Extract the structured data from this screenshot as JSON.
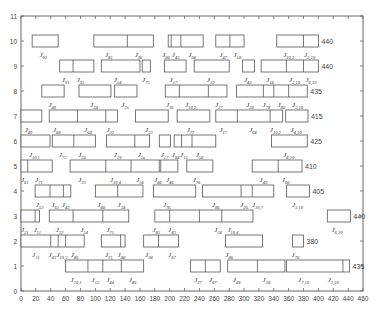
{
  "chart_data": {
    "type": "gantt",
    "title": "",
    "xlabel": "",
    "ylabel": "",
    "xlim": [
      0,
      460
    ],
    "ylim": [
      0,
      11
    ],
    "xticks": [
      0,
      20,
      40,
      60,
      80,
      100,
      120,
      140,
      160,
      180,
      200,
      220,
      240,
      260,
      280,
      300,
      320,
      340,
      360,
      380,
      400,
      420,
      440,
      460
    ],
    "yticks": [
      0,
      1,
      2,
      3,
      4,
      5,
      6,
      7,
      8,
      9,
      10,
      11
    ],
    "grid": false,
    "rows": [
      {
        "y": 10,
        "right_value": "440",
        "boxes": [
          {
            "start": 15,
            "end": 50,
            "splits": [],
            "labels": [
              {
                "x": 30,
                "text": "J02"
              }
            ]
          },
          {
            "start": 98,
            "end": 178,
            "splits": [
              143
            ],
            "labels": [
              {
                "x": 118,
                "text": "J85"
              },
              {
                "x": 158,
                "text": "J96"
              }
            ]
          },
          {
            "start": 198,
            "end": 245,
            "splits": [
              202,
              215
            ],
            "labels": [
              {
                "x": 195,
                "text": "J86"
              },
              {
                "x": 208,
                "text": "J45"
              },
              {
                "x": 230,
                "text": "J98"
              }
            ]
          },
          {
            "start": 262,
            "end": 300,
            "splits": [
              281
            ],
            "labels": [
              {
                "x": 272,
                "text": "J47"
              },
              {
                "x": 291,
                "text": "J58"
              }
            ]
          },
          {
            "start": 344,
            "end": 400,
            "splits": [
              380
            ],
            "labels": [
              {
                "x": 360,
                "text": "J10,3"
              },
              {
                "x": 388,
                "text": "J3,10"
              }
            ]
          }
        ]
      },
      {
        "y": 9,
        "right_value": "440",
        "boxes": [
          {
            "start": 52,
            "end": 98,
            "splits": [
              70
            ],
            "labels": [
              {
                "x": 60,
                "text": "J91"
              },
              {
                "x": 80,
                "text": "J92"
              }
            ]
          },
          {
            "start": 108,
            "end": 160,
            "splits": [],
            "labels": [
              {
                "x": 130,
                "text": "J54"
              }
            ]
          },
          {
            "start": 163,
            "end": 174,
            "splits": [],
            "labels": [
              {
                "x": 168,
                "text": "J75"
              }
            ]
          },
          {
            "start": 193,
            "end": 222,
            "splits": [],
            "labels": [
              {
                "x": 205,
                "text": "J17"
              }
            ]
          },
          {
            "start": 233,
            "end": 280,
            "splits": [],
            "labels": [
              {
                "x": 255,
                "text": "J19"
              }
            ]
          },
          {
            "start": 298,
            "end": 314,
            "splits": [],
            "labels": [
              {
                "x": 305,
                "text": "J42"
              }
            ]
          },
          {
            "start": 323,
            "end": 400,
            "splits": [
              357,
              380
            ],
            "labels": [
              {
                "x": 335,
                "text": "J18"
              },
              {
                "x": 368,
                "text": "J2,10"
              },
              {
                "x": 390,
                "text": "J8,10"
              }
            ]
          }
        ]
      },
      {
        "y": 8,
        "right_value": "435",
        "boxes": [
          {
            "start": 28,
            "end": 58,
            "splits": [],
            "labels": [
              {
                "x": 42,
                "text": "J40"
              }
            ]
          },
          {
            "start": 78,
            "end": 121,
            "splits": [],
            "labels": [
              {
                "x": 98,
                "text": "J34"
              }
            ]
          },
          {
            "start": 126,
            "end": 156,
            "splits": [],
            "labels": [
              {
                "x": 140,
                "text": "J25"
              }
            ]
          },
          {
            "start": 194,
            "end": 277,
            "splits": [
              213,
              252
            ],
            "labels": [
              {
                "x": 200,
                "text": "J36"
              },
              {
                "x": 228,
                "text": "J10,2"
              },
              {
                "x": 266,
                "text": "J27"
              }
            ]
          },
          {
            "start": 290,
            "end": 385,
            "splits": [
              326,
              340,
              360
            ],
            "labels": [
              {
                "x": 308,
                "text": "J28"
              },
              {
                "x": 330,
                "text": "J78"
              },
              {
                "x": 350,
                "text": "J88"
              },
              {
                "x": 372,
                "text": "J3,10"
              }
            ]
          }
        ]
      },
      {
        "y": 7,
        "right_value": "415",
        "boxes": [
          {
            "start": 0,
            "end": 28,
            "splits": [],
            "labels": [
              {
                "x": 10,
                "text": "J40"
              }
            ]
          },
          {
            "start": 38,
            "end": 130,
            "splits": [
              76,
              114
            ],
            "labels": [
              {
                "x": 48,
                "text": "J88"
              },
              {
                "x": 90,
                "text": "J64"
              },
              {
                "x": 120,
                "text": "J32"
              }
            ]
          },
          {
            "start": 154,
            "end": 198,
            "splits": [],
            "labels": [
              {
                "x": 172,
                "text": "J23"
              }
            ]
          },
          {
            "start": 210,
            "end": 254,
            "splits": [],
            "labels": [
              {
                "x": 228,
                "text": "J77"
              }
            ]
          },
          {
            "start": 262,
            "end": 352,
            "splits": [
              291,
              335
            ],
            "labels": [
              {
                "x": 272,
                "text": "J17"
              },
              {
                "x": 312,
                "text": "J68"
              },
              {
                "x": 342,
                "text": "J10,2"
              }
            ]
          },
          {
            "start": 356,
            "end": 386,
            "splits": [],
            "labels": [
              {
                "x": 370,
                "text": "J4,10"
              }
            ]
          }
        ]
      },
      {
        "y": 6,
        "right_value": "425",
        "boxes": [
          {
            "start": 0,
            "end": 39,
            "splits": [],
            "labels": [
              {
                "x": 18,
                "text": "J10,1"
              }
            ]
          },
          {
            "start": 42,
            "end": 100,
            "splits": [
              71
            ],
            "labels": [
              {
                "x": 56,
                "text": "J72"
              },
              {
                "x": 82,
                "text": "J26"
              }
            ]
          },
          {
            "start": 115,
            "end": 173,
            "splits": [
              153
            ],
            "labels": [
              {
                "x": 130,
                "text": "J29"
              },
              {
                "x": 162,
                "text": "J2e"
              }
            ]
          },
          {
            "start": 186,
            "end": 201,
            "splits": [],
            "labels": [
              {
                "x": 193,
                "text": "J17"
              }
            ]
          },
          {
            "start": 206,
            "end": 262,
            "splits": [
              216,
              230
            ],
            "labels": [
              {
                "x": 208,
                "text": "J84"
              },
              {
                "x": 219,
                "text": "J15"
              },
              {
                "x": 240,
                "text": "J58"
              }
            ]
          },
          {
            "start": 337,
            "end": 385,
            "splits": [],
            "labels": [
              {
                "x": 360,
                "text": "J4,10"
              }
            ]
          }
        ]
      },
      {
        "y": 5,
        "right_value": "410",
        "boxes": [
          {
            "start": 0,
            "end": 42,
            "splits": [
              9
            ],
            "labels": [
              {
                "x": 5,
                "text": "J81"
              },
              {
                "x": 24,
                "text": "J71"
              }
            ]
          },
          {
            "start": 66,
            "end": 211,
            "splits": [
              114,
              148,
              186,
              188
            ],
            "labels": [
              {
                "x": 82,
                "text": "J23"
              },
              {
                "x": 127,
                "text": "J10,4"
              },
              {
                "x": 160,
                "text": "J36"
              },
              {
                "x": 184,
                "text": "J88"
              },
              {
                "x": 200,
                "text": "J46"
              }
            ]
          },
          {
            "start": 223,
            "end": 258,
            "splits": [],
            "labels": [
              {
                "x": 236,
                "text": "J76"
              }
            ]
          },
          {
            "start": 311,
            "end": 378,
            "splits": [
              346
            ],
            "labels": [
              {
                "x": 326,
                "text": "J49"
              },
              {
                "x": 356,
                "text": "J66"
              }
            ]
          }
        ]
      },
      {
        "y": 4,
        "right_value": "405",
        "boxes": [
          {
            "start": 19,
            "end": 67,
            "splits": [
              39,
              57
            ],
            "labels": [
              {
                "x": 25,
                "text": "J52"
              },
              {
                "x": 46,
                "text": "J61"
              },
              {
                "x": 60,
                "text": "J42"
              }
            ]
          },
          {
            "start": 100,
            "end": 164,
            "splits": [
              130
            ],
            "labels": [
              {
                "x": 108,
                "text": "J88"
              },
              {
                "x": 135,
                "text": "J34"
              }
            ]
          },
          {
            "start": 178,
            "end": 235,
            "splits": [],
            "labels": [
              {
                "x": 196,
                "text": "J76"
              }
            ]
          },
          {
            "start": 244,
            "end": 340,
            "splits": [
              296,
              311
            ],
            "labels": [
              {
                "x": 262,
                "text": "J86"
              },
              {
                "x": 300,
                "text": "J26"
              },
              {
                "x": 318,
                "text": "J10,7"
              }
            ]
          },
          {
            "start": 357,
            "end": 388,
            "splits": [],
            "labels": [
              {
                "x": 372,
                "text": "J5,10"
              }
            ]
          }
        ]
      },
      {
        "y": 3,
        "right_value": "440",
        "boxes": [
          {
            "start": 0,
            "end": 25,
            "splits": [
              19
            ],
            "labels": [
              {
                "x": 5,
                "text": "J21"
              },
              {
                "x": 22,
                "text": "J11"
              }
            ]
          },
          {
            "start": 38,
            "end": 145,
            "splits": [
              70,
              110
            ],
            "labels": [
              {
                "x": 52,
                "text": "J22"
              },
              {
                "x": 85,
                "text": "J14"
              },
              {
                "x": 120,
                "text": "J71"
              }
            ]
          },
          {
            "start": 180,
            "end": 312,
            "splits": [
              200,
              240,
              270
            ],
            "labels": [
              {
                "x": 182,
                "text": "J83"
              },
              {
                "x": 203,
                "text": "J43"
              },
              {
                "x": 265,
                "text": "J58"
              },
              {
                "x": 285,
                "text": "J10,4"
              }
            ]
          },
          {
            "start": 412,
            "end": 443,
            "splits": [],
            "labels": [
              {
                "x": 425,
                "text": "J6,10"
              }
            ]
          }
        ]
      },
      {
        "y": 2,
        "right_value": "380",
        "boxes": [
          {
            "start": 0,
            "end": 85,
            "splits": [
              40,
              50,
              60
            ],
            "labels": [
              {
                "x": 20,
                "text": "J31"
              },
              {
                "x": 42,
                "text": "J43"
              },
              {
                "x": 55,
                "text": "J10,3"
              },
              {
                "x": 72,
                "text": "J86"
              }
            ]
          },
          {
            "start": 108,
            "end": 140,
            "splits": [
              134
            ],
            "labels": [
              {
                "x": 118,
                "text": "J75"
              },
              {
                "x": 135,
                "text": "J88"
              }
            ]
          },
          {
            "start": 165,
            "end": 212,
            "splits": [
              185
            ],
            "labels": [
              {
                "x": 172,
                "text": "J94"
              },
              {
                "x": 203,
                "text": "J67"
              }
            ]
          },
          {
            "start": 275,
            "end": 325,
            "splits": [],
            "labels": [
              {
                "x": 280,
                "text": "J86"
              }
            ]
          },
          {
            "start": 365,
            "end": 380,
            "splits": [],
            "labels": [
              {
                "x": 369,
                "text": "J76"
              }
            ]
          }
        ]
      },
      {
        "y": 1,
        "right_value": "435",
        "boxes": [
          {
            "start": 60,
            "end": 165,
            "splits": [
              90,
              110,
              135
            ],
            "labels": [
              {
                "x": 74,
                "text": "J10,1"
              },
              {
                "x": 100,
                "text": "J12"
              },
              {
                "x": 120,
                "text": "J44"
              },
              {
                "x": 150,
                "text": "J86"
              }
            ]
          },
          {
            "start": 228,
            "end": 268,
            "splits": [
              248
            ],
            "labels": [
              {
                "x": 238,
                "text": "J27"
              },
              {
                "x": 258,
                "text": "J67"
              }
            ]
          },
          {
            "start": 278,
            "end": 355,
            "splits": [
              318
            ],
            "labels": [
              {
                "x": 290,
                "text": "J88"
              },
              {
                "x": 330,
                "text": "J28"
              }
            ]
          },
          {
            "start": 357,
            "end": 442,
            "splits": [
              433
            ],
            "labels": [
              {
                "x": 380,
                "text": "J7,10"
              },
              {
                "x": 420,
                "text": "J3,10"
              }
            ]
          }
        ]
      }
    ]
  }
}
